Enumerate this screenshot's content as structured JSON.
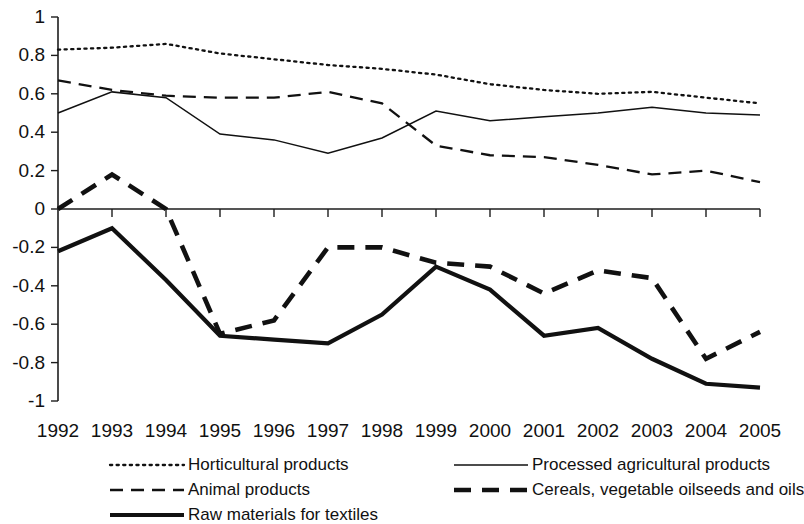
{
  "chart_data": {
    "type": "line",
    "title": "",
    "xlabel": "",
    "ylabel": "",
    "grid": false,
    "legend_position": "bottom",
    "x": [
      1992,
      1993,
      1994,
      1995,
      1996,
      1997,
      1998,
      1999,
      2000,
      2001,
      2002,
      2003,
      2004,
      2005
    ],
    "categories": [
      "1992",
      "1993",
      "1994",
      "1995",
      "1996",
      "1997",
      "1998",
      "1999",
      "2000",
      "2001",
      "2002",
      "2003",
      "2004",
      "2005"
    ],
    "ylim": [
      -1,
      1
    ],
    "ytick_labels": [
      "1",
      "0.8",
      "0.6",
      "0.4",
      "0.2",
      "0",
      "-0.2",
      "-0.4",
      "-0.6",
      "-0.8",
      "-1"
    ],
    "ytick_values": [
      1,
      0.8,
      0.6,
      0.4,
      0.2,
      0,
      -0.2,
      -0.4,
      -0.6,
      -0.8,
      -1
    ],
    "series": [
      {
        "name": "Horticultural products",
        "style": "dotted",
        "color": "#111111",
        "values": [
          0.83,
          0.84,
          0.86,
          0.81,
          0.78,
          0.75,
          0.73,
          0.7,
          0.65,
          0.62,
          0.6,
          0.61,
          0.58,
          0.55
        ]
      },
      {
        "name": "Processed agricultural products",
        "style": "solid-thin",
        "color": "#111111",
        "values": [
          0.5,
          0.61,
          0.58,
          0.39,
          0.36,
          0.29,
          0.37,
          0.51,
          0.46,
          0.48,
          0.5,
          0.53,
          0.5,
          0.49
        ]
      },
      {
        "name": "Animal products",
        "style": "dashed",
        "color": "#111111",
        "values": [
          0.67,
          0.62,
          0.59,
          0.58,
          0.58,
          0.61,
          0.55,
          0.33,
          0.28,
          0.27,
          0.23,
          0.18,
          0.2,
          0.14
        ]
      },
      {
        "name": "Cereals, vegetable oilseeds and oils",
        "style": "dashed-thick",
        "color": "#111111",
        "values": [
          0.0,
          0.18,
          0.0,
          -0.65,
          -0.58,
          -0.2,
          -0.2,
          -0.28,
          -0.3,
          -0.44,
          -0.32,
          -0.36,
          -0.78,
          -0.64
        ]
      },
      {
        "name": "Raw materials for textiles",
        "style": "solid-thick",
        "color": "#111111",
        "values": [
          -0.22,
          -0.1,
          -0.37,
          -0.66,
          -0.68,
          -0.7,
          -0.55,
          -0.3,
          -0.42,
          -0.66,
          -0.62,
          -0.78,
          -0.91,
          -0.93
        ]
      }
    ]
  },
  "legend": {
    "items": [
      {
        "label": "Horticultural products",
        "style": "dotted"
      },
      {
        "label": "Processed agricultural products",
        "style": "solid-thin"
      },
      {
        "label": "Animal products",
        "style": "dashed"
      },
      {
        "label": "Cereals, vegetable oilseeds and oils",
        "style": "dashed-thick"
      },
      {
        "label": "Raw materials for textiles",
        "style": "solid-thick"
      }
    ]
  }
}
